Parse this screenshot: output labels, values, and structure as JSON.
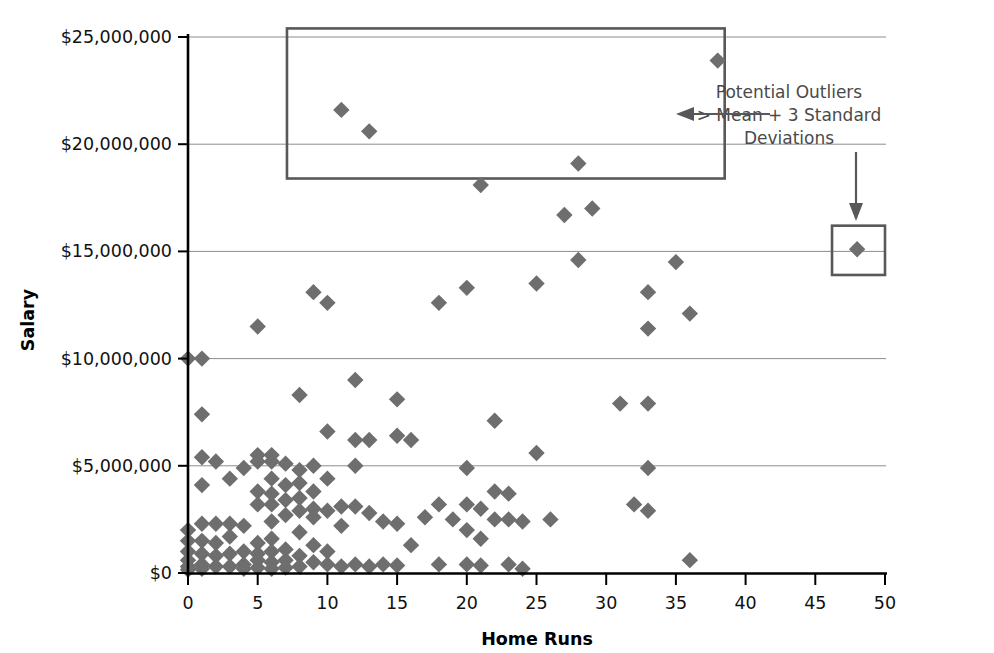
{
  "chart_data": {
    "type": "scatter",
    "title": "",
    "xlabel": "Home Runs",
    "ylabel": "Salary",
    "xlim": [
      0,
      50
    ],
    "ylim": [
      0,
      25000000
    ],
    "grid": true,
    "legend": "none",
    "x_ticks": [
      "0",
      "5",
      "10",
      "15",
      "20",
      "25",
      "30",
      "35",
      "40",
      "45",
      "50"
    ],
    "x_tick_values": [
      0,
      5,
      10,
      15,
      20,
      25,
      30,
      35,
      40,
      45,
      50
    ],
    "y_ticks": [
      "$0",
      "$5,000,000",
      "$10,000,000",
      "$15,000,000",
      "$20,000,000",
      "$25,000,000"
    ],
    "y_tick_values": [
      0,
      5000000,
      10000000,
      15000000,
      20000000,
      25000000
    ],
    "marker": "diamond",
    "marker_color": "#6e6e6e",
    "series": [
      {
        "name": "Players",
        "points": [
          [
            0,
            10000000
          ],
          [
            1,
            10000000
          ],
          [
            1,
            7400000
          ],
          [
            1,
            5400000
          ],
          [
            1,
            4100000
          ],
          [
            1,
            2300000
          ],
          [
            0,
            2000000
          ],
          [
            0,
            1500000
          ],
          [
            0,
            1000000
          ],
          [
            0,
            600000
          ],
          [
            0,
            300000
          ],
          [
            0,
            150000
          ],
          [
            1,
            1500000
          ],
          [
            1,
            900000
          ],
          [
            1,
            400000
          ],
          [
            1,
            200000
          ],
          [
            2,
            5200000
          ],
          [
            2,
            2300000
          ],
          [
            2,
            1400000
          ],
          [
            2,
            800000
          ],
          [
            2,
            300000
          ],
          [
            3,
            4400000
          ],
          [
            3,
            2300000
          ],
          [
            3,
            1700000
          ],
          [
            3,
            900000
          ],
          [
            3,
            300000
          ],
          [
            4,
            4900000
          ],
          [
            4,
            2200000
          ],
          [
            4,
            1000000
          ],
          [
            4,
            400000
          ],
          [
            4,
            200000
          ],
          [
            5,
            11500000
          ],
          [
            5,
            5500000
          ],
          [
            5,
            5200000
          ],
          [
            5,
            3800000
          ],
          [
            5,
            3200000
          ],
          [
            5,
            1400000
          ],
          [
            5,
            900000
          ],
          [
            5,
            600000
          ],
          [
            5,
            250000
          ],
          [
            6,
            5500000
          ],
          [
            6,
            5200000
          ],
          [
            6,
            4400000
          ],
          [
            6,
            3700000
          ],
          [
            6,
            3200000
          ],
          [
            6,
            2400000
          ],
          [
            6,
            1600000
          ],
          [
            6,
            1000000
          ],
          [
            6,
            500000
          ],
          [
            6,
            200000
          ],
          [
            7,
            5100000
          ],
          [
            7,
            4100000
          ],
          [
            7,
            3400000
          ],
          [
            7,
            2700000
          ],
          [
            7,
            1100000
          ],
          [
            7,
            600000
          ],
          [
            7,
            250000
          ],
          [
            8,
            8300000
          ],
          [
            8,
            4800000
          ],
          [
            8,
            4200000
          ],
          [
            8,
            3500000
          ],
          [
            8,
            2900000
          ],
          [
            8,
            1900000
          ],
          [
            8,
            800000
          ],
          [
            8,
            300000
          ],
          [
            9,
            13100000
          ],
          [
            9,
            5000000
          ],
          [
            9,
            3800000
          ],
          [
            9,
            3000000
          ],
          [
            9,
            2600000
          ],
          [
            9,
            1300000
          ],
          [
            9,
            500000
          ],
          [
            10,
            12600000
          ],
          [
            10,
            6600000
          ],
          [
            10,
            4400000
          ],
          [
            10,
            2900000
          ],
          [
            10,
            1000000
          ],
          [
            10,
            400000
          ],
          [
            11,
            21600000
          ],
          [
            11,
            3100000
          ],
          [
            11,
            2200000
          ],
          [
            11,
            300000
          ],
          [
            12,
            9000000
          ],
          [
            12,
            6200000
          ],
          [
            12,
            5000000
          ],
          [
            12,
            3100000
          ],
          [
            12,
            400000
          ],
          [
            13,
            20600000
          ],
          [
            13,
            6200000
          ],
          [
            13,
            2800000
          ],
          [
            13,
            300000
          ],
          [
            14,
            2400000
          ],
          [
            14,
            400000
          ],
          [
            15,
            8100000
          ],
          [
            15,
            6400000
          ],
          [
            15,
            2300000
          ],
          [
            15,
            350000
          ],
          [
            16,
            6200000
          ],
          [
            16,
            1300000
          ],
          [
            17,
            2600000
          ],
          [
            18,
            12600000
          ],
          [
            18,
            3200000
          ],
          [
            18,
            400000
          ],
          [
            19,
            2500000
          ],
          [
            20,
            13300000
          ],
          [
            20,
            4900000
          ],
          [
            20,
            3200000
          ],
          [
            20,
            2000000
          ],
          [
            20,
            400000
          ],
          [
            21,
            18100000
          ],
          [
            21,
            3000000
          ],
          [
            21,
            1600000
          ],
          [
            21,
            350000
          ],
          [
            22,
            7100000
          ],
          [
            22,
            3800000
          ],
          [
            22,
            2500000
          ],
          [
            23,
            3700000
          ],
          [
            23,
            2500000
          ],
          [
            23,
            400000
          ],
          [
            24,
            2400000
          ],
          [
            24,
            200000
          ],
          [
            25,
            13500000
          ],
          [
            25,
            5600000
          ],
          [
            26,
            2500000
          ],
          [
            27,
            16700000
          ],
          [
            28,
            19100000
          ],
          [
            28,
            14600000
          ],
          [
            29,
            17000000
          ],
          [
            31,
            7900000
          ],
          [
            32,
            3200000
          ],
          [
            33,
            13100000
          ],
          [
            33,
            11400000
          ],
          [
            33,
            7900000
          ],
          [
            33,
            4900000
          ],
          [
            33,
            2900000
          ],
          [
            35,
            14500000
          ],
          [
            36,
            12100000
          ],
          [
            36,
            600000
          ],
          [
            38,
            23900000
          ],
          [
            48,
            15100000
          ]
        ]
      }
    ],
    "annotations": [
      {
        "name": "potential-outliers-label",
        "lines": [
          "Potential Outliers",
          "> Mean + 3 Standard",
          "Deviations"
        ]
      }
    ],
    "highlight_boxes": [
      {
        "name": "upper-outlier-box",
        "x_range": [
          7.1,
          38.5
        ],
        "y_range": [
          18400000,
          25400000
        ]
      },
      {
        "name": "right-outlier-box",
        "x_range": [
          46.2,
          50.0
        ],
        "y_range": [
          13900000,
          16200000
        ]
      }
    ]
  }
}
